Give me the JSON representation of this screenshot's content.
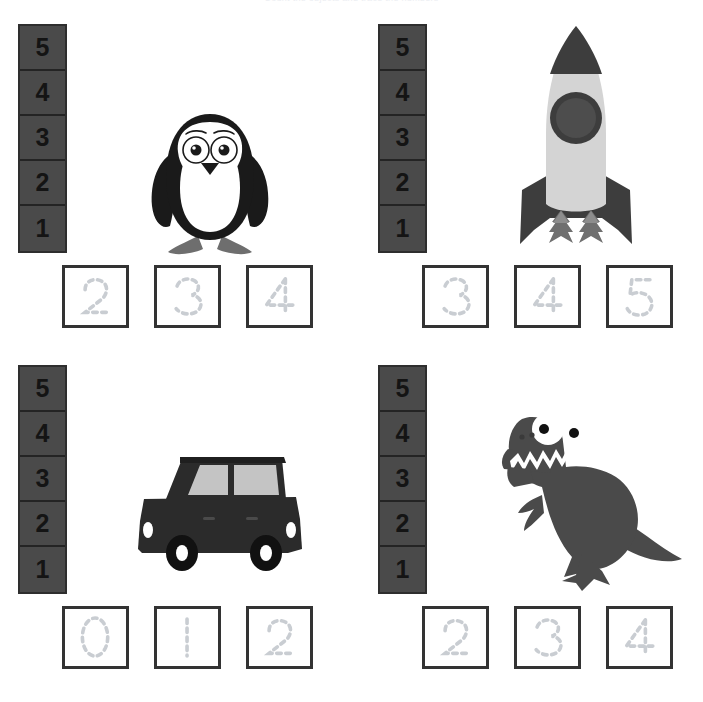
{
  "title": "Count the objects and trace the numbers",
  "colors": {
    "ladder_fill": "#4a4a4a",
    "ladder_border": "#2e2e2e",
    "ladder_digit": "#141414",
    "trace_box_border": "#333333",
    "trace_glyph": "#c9cdd2",
    "page_background": "#ffffff",
    "dark_gray": "#4a4a4a",
    "light_gray": "#cfcfcf",
    "mid_gray": "#8d8d8d",
    "black": "#1a1a1a",
    "white": "#ffffff"
  },
  "ladder": {
    "label": "number ladder",
    "cells": [
      "5",
      "4",
      "3",
      "2",
      "1"
    ]
  },
  "panels": [
    {
      "id": "penguin",
      "picture_name": "penguin-illustration",
      "picture_label": "penguin",
      "trace_numbers": [
        "2",
        "3",
        "4"
      ]
    },
    {
      "id": "rocket",
      "picture_name": "rocket-illustration",
      "picture_label": "rocket",
      "trace_numbers": [
        "3",
        "4",
        "5"
      ]
    },
    {
      "id": "car",
      "picture_name": "car-illustration",
      "picture_label": "car",
      "trace_numbers": [
        "0",
        "1",
        "2"
      ]
    },
    {
      "id": "dinosaur",
      "picture_name": "dinosaur-illustration",
      "picture_label": "dinosaur",
      "trace_numbers": [
        "2",
        "3",
        "4"
      ]
    }
  ]
}
